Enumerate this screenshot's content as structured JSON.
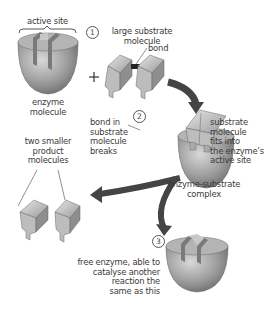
{
  "diagram": {
    "steps": [
      {
        "number": "1",
        "labels": {
          "active_site": "active site",
          "enzyme": [
            "enzyme",
            "molecule"
          ],
          "substrate": [
            "large substrate",
            "molecule"
          ],
          "bond": "bond",
          "plus": "+"
        }
      },
      {
        "number": "2",
        "labels": {
          "bond_breaks": [
            "bond in",
            "substrate",
            "molecule",
            "breaks"
          ],
          "fits": [
            "substrate",
            "molecule",
            "fits into",
            "the enzyme's",
            "active site"
          ],
          "complex": [
            "enzyme-substrate",
            "complex"
          ]
        }
      },
      {
        "number": "3",
        "labels": {
          "free_enzyme": [
            "free enzyme, able to",
            "catalyse another",
            "reaction the",
            "same as this"
          ]
        }
      }
    ],
    "products": [
      "two smaller",
      "product",
      "molecules"
    ],
    "colors": {
      "enzyme_fill": "#9a9a9a",
      "enzyme_light": "#c8c8c8",
      "arrow": "#444444",
      "bond": "#222222",
      "text": "#3a3a3a"
    }
  }
}
